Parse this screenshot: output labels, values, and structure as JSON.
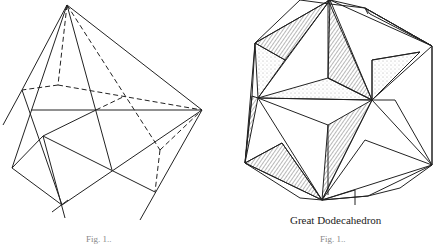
{
  "figures": [
    {
      "id": "left",
      "caption": "",
      "fig_label": "Fig. 1..",
      "subject": "pyramid-construction-drawing"
    },
    {
      "id": "right",
      "caption": "Great Dodecahedron",
      "fig_label": "Fig. 1..",
      "subject": "great-dodecahedron"
    }
  ]
}
